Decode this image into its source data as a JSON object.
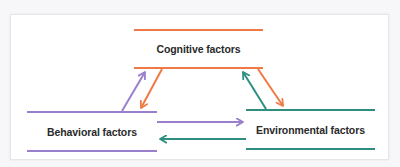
{
  "diagram": {
    "title": "",
    "colors": {
      "cognitive": "#f07a45",
      "behavioral": "#9a80cc",
      "environmental": "#2e8f80",
      "text": "#2a2a2a",
      "panel_border": "#e6e6ea"
    },
    "nodes": [
      {
        "id": "cognitive",
        "label": "Cognitive factors"
      },
      {
        "id": "behavioral",
        "label": "Behavioral factors"
      },
      {
        "id": "environmental",
        "label": "Environmental factors"
      }
    ],
    "edges": [
      {
        "from": "behavioral",
        "to": "cognitive",
        "color": "behavioral"
      },
      {
        "from": "cognitive",
        "to": "behavioral",
        "color": "cognitive"
      },
      {
        "from": "environmental",
        "to": "cognitive",
        "color": "environmental"
      },
      {
        "from": "cognitive",
        "to": "environmental",
        "color": "cognitive"
      },
      {
        "from": "behavioral",
        "to": "environmental",
        "color": "behavioral"
      },
      {
        "from": "environmental",
        "to": "behavioral",
        "color": "environmental"
      }
    ]
  }
}
